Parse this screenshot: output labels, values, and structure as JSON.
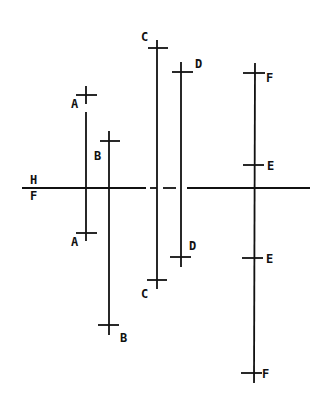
{
  "diagram": {
    "type": "orthographic-projection-lines",
    "stroke_color": "#111111",
    "background": "#ffffff",
    "reference_line": {
      "label_above": "H",
      "label_below": "F",
      "y": 188,
      "segments": [
        [
          22,
          146
        ],
        [
          150,
          157
        ],
        [
          163,
          176
        ],
        [
          187,
          310
        ]
      ]
    },
    "lines": [
      {
        "name": "A",
        "x": 86,
        "line_from": 112,
        "line_to": 241,
        "top_tick": {
          "y": 95,
          "x1": 76,
          "x2": 97,
          "v_from": 86,
          "v_to": 104,
          "label": "A",
          "lx": 71,
          "ly": 108
        },
        "bottom_tick": {
          "y": 233,
          "x1": 76,
          "x2": 97,
          "label": "A",
          "lx": 71,
          "ly": 246
        }
      },
      {
        "name": "B",
        "x": 109,
        "line_from": 131,
        "line_to": 335,
        "top_tick": {
          "y": 141,
          "x1": 100,
          "x2": 120,
          "label": "B",
          "lx": 94,
          "ly": 160
        },
        "bottom_tick": {
          "y": 325,
          "x1": 98,
          "x2": 119,
          "label": "B",
          "lx": 120,
          "ly": 342
        }
      },
      {
        "name": "C",
        "x": 157,
        "line_from": 40,
        "line_to": 289,
        "top_tick": {
          "y": 48,
          "x1": 148,
          "x2": 168,
          "label": "C",
          "lx": 142,
          "ly": 40
        },
        "bottom_tick": {
          "y": 280,
          "x1": 147,
          "x2": 167,
          "label": "C",
          "lx": 141,
          "ly": 298
        }
      },
      {
        "name": "D",
        "x": 181,
        "line_from": 62,
        "line_to": 267,
        "top_tick": {
          "y": 72,
          "x1": 172,
          "x2": 193,
          "label": "D",
          "lx": 195,
          "ly": 68
        },
        "bottom_tick": {
          "y": 257,
          "x1": 170,
          "x2": 191,
          "label": "D",
          "lx": 190,
          "ly": 250
        }
      },
      {
        "name": "F",
        "x": 254,
        "line_from": 63,
        "line_to": 383,
        "ticks": [
          {
            "y": 73,
            "x1": 243,
            "x2": 264,
            "label": "F",
            "lx": 266,
            "ly": 82
          },
          {
            "y": 165,
            "x1": 243,
            "x2": 264,
            "label": "E",
            "lx": 267,
            "ly": 170
          },
          {
            "y": 258,
            "x1": 242,
            "x2": 263,
            "label": "E",
            "lx": 266,
            "ly": 263
          },
          {
            "y": 373,
            "x1": 241,
            "x2": 262,
            "label": "F",
            "lx": 262,
            "ly": 378
          }
        ]
      }
    ],
    "labels": [
      "H",
      "F",
      "A",
      "A",
      "B",
      "B",
      "C",
      "C",
      "D",
      "D",
      "F",
      "E",
      "E",
      "F"
    ]
  },
  "text": {
    "ref_h": "H",
    "ref_f": "F",
    "a_top": "A",
    "a_bottom": "A",
    "b_top": "B",
    "b_bottom": "B",
    "c_top": "C",
    "c_bottom": "C",
    "d_top": "D",
    "d_bottom": "D",
    "f_top": "F",
    "e_upper": "E",
    "e_lower": "E",
    "f_bottom": "F"
  }
}
